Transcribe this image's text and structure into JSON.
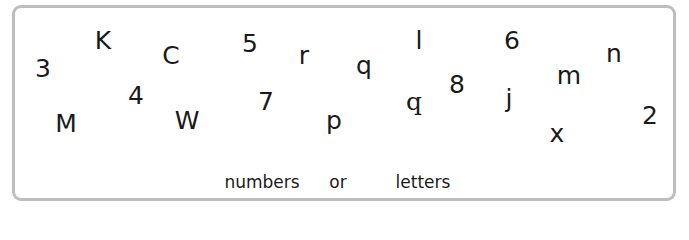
{
  "panel": {
    "border_color": "#bdbdbd",
    "text_color": "#1a1a1a"
  },
  "glyphs": [
    {
      "char": "3",
      "x": 43,
      "y": 68
    },
    {
      "char": "K",
      "x": 103,
      "y": 40
    },
    {
      "char": "C",
      "x": 171,
      "y": 55
    },
    {
      "char": "5",
      "x": 250,
      "y": 43
    },
    {
      "char": "r",
      "x": 304,
      "y": 55
    },
    {
      "char": "q",
      "x": 364,
      "y": 65
    },
    {
      "char": "l",
      "x": 419,
      "y": 40
    },
    {
      "char": "6",
      "x": 512,
      "y": 40
    },
    {
      "char": "n",
      "x": 614,
      "y": 53
    },
    {
      "char": "4",
      "x": 136,
      "y": 95
    },
    {
      "char": "M",
      "x": 66,
      "y": 123
    },
    {
      "char": "W",
      "x": 187,
      "y": 120
    },
    {
      "char": "7",
      "x": 266,
      "y": 101
    },
    {
      "char": "p",
      "x": 334,
      "y": 120
    },
    {
      "char": "q",
      "x": 414,
      "y": 101,
      "style": "serif"
    },
    {
      "char": "8",
      "x": 457,
      "y": 84
    },
    {
      "char": "j",
      "x": 509,
      "y": 98
    },
    {
      "char": "m",
      "x": 569,
      "y": 75
    },
    {
      "char": "2",
      "x": 650,
      "y": 115
    },
    {
      "char": "x",
      "x": 557,
      "y": 133
    }
  ],
  "caption": {
    "words": [
      {
        "text": "numbers",
        "x": 262
      },
      {
        "text": "or",
        "x": 338
      },
      {
        "text": "letters",
        "x": 423
      }
    ]
  }
}
